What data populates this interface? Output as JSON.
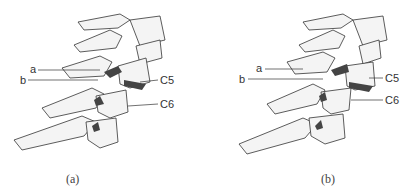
{
  "figure": {
    "panels": [
      {
        "id": "a",
        "caption": "(a)",
        "labels": {
          "a": "a",
          "b": "b",
          "c5": "C5",
          "c6": "C6"
        }
      },
      {
        "id": "b",
        "caption": "(b)",
        "labels": {
          "a": "a",
          "b": "b",
          "c5": "C5",
          "c6": "C6"
        }
      }
    ],
    "colors": {
      "ink": "#333333",
      "bone": "#f2f2f2",
      "shadow": "#555555"
    }
  }
}
